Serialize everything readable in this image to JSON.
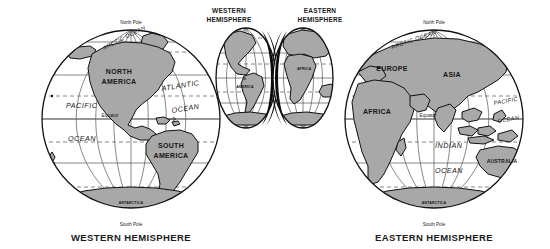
{
  "figure": {
    "caption_left": "WESTERN HEMISPHERE",
    "caption_right": "EASTERN HEMISPHERE",
    "background_color": "#ffffff",
    "land_color": "#a8a8a8",
    "ocean_color": "#ffffff",
    "line_color": "#555555",
    "outline_color": "#111111",
    "slice_color": "#0b0b0b"
  },
  "western_globe": {
    "name": "WESTERN HEMISPHERE",
    "north_pole": "North Pole",
    "south_pole": "South Pole",
    "equator": "Equator",
    "continents": [
      {
        "label": "NORTH",
        "label2": "AMERICA"
      },
      {
        "label": "SOUTH",
        "label2": "AMERICA"
      },
      {
        "label": "ANTARCTICA"
      }
    ],
    "oceans": [
      {
        "label": "ARCTIC OCEAN"
      },
      {
        "label": "ATLANTIC",
        "label2": "OCEAN"
      },
      {
        "label": "PACIFIC",
        "label2": "OCEAN"
      }
    ],
    "north_america_line1": "NORTH",
    "north_america_line2": "AMERICA",
    "south_america_line1": "SOUTH",
    "south_america_line2": "AMERICA",
    "antarctica": "ANTARCTICA",
    "arctic_ocean": "ARCTIC OCEAN",
    "atlantic_line1": "ATLANTIC",
    "atlantic_line2": "OCEAN",
    "pacific_line1": "PACIFIC",
    "pacific_line2": "OCEAN"
  },
  "eastern_globe": {
    "name": "EASTERN HEMISPHERE",
    "north_pole": "North Pole",
    "south_pole": "South Pole",
    "equator": "Equator",
    "arctic_ocean": "ARCTIC OCEAN",
    "europe": "EUROPE",
    "asia": "ASIA",
    "africa": "AFRICA",
    "australia": "AUSTRALIA",
    "antarctica": "ANTARCTICA",
    "indian_line1": "INDIAN",
    "indian_line2": "OCEAN",
    "pacific_line1": "PACIFIC",
    "pacific_line2": "OCEAN"
  },
  "mini_western": {
    "title_line1": "WESTERN",
    "title_line2": "HEMISPHERE",
    "continent_line1": "S.",
    "continent_line2": "AMERICA"
  },
  "mini_eastern": {
    "title_line1": "EASTERN",
    "title_line2": "HEMISPHERE",
    "continent_line1": "AFRICA"
  }
}
